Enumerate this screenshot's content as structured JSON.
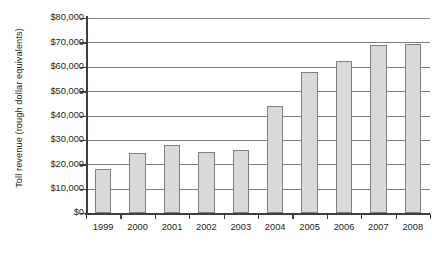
{
  "chart_data": {
    "type": "bar",
    "title": "",
    "subtitle": "",
    "xlabel": "",
    "ylabel": "Toll revenue (rough dollar equivalents)",
    "categories": [
      "1999",
      "2000",
      "2001",
      "2002",
      "2003",
      "2004",
      "2005",
      "2006",
      "2007",
      "2008"
    ],
    "values": [
      18000,
      24500,
      28000,
      25200,
      26000,
      44000,
      57800,
      62500,
      69000,
      69500
    ],
    "series": [
      {
        "name": "Toll revenue",
        "values": [
          18000,
          24500,
          28000,
          25200,
          26000,
          44000,
          57800,
          62500,
          69000,
          69500
        ]
      }
    ],
    "ylim": [
      0,
      80000
    ],
    "ytick_values": [
      0,
      10000,
      20000,
      30000,
      40000,
      50000,
      60000,
      70000,
      80000
    ],
    "ytick_labels": [
      "$0",
      "$10,000",
      "$20,000",
      "$30,000",
      "$40,000",
      "$50,000",
      "$60,000",
      "$70,000",
      "$80,000"
    ],
    "xtick_labels": [
      "1999",
      "2000",
      "2001",
      "2002",
      "2003",
      "2004",
      "2005",
      "2006",
      "2007",
      "2008"
    ],
    "grid": true,
    "grid_axis": "y",
    "legend": false,
    "legend_position": "none",
    "annotations": [],
    "colors": {
      "bar_fill": "#d9d9d9",
      "bar_border": "#808080",
      "gridline": "#7d7d7d",
      "axis": "#3d3d3d",
      "text": "#231f20",
      "background": "#ffffff"
    }
  }
}
